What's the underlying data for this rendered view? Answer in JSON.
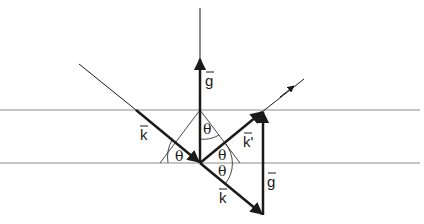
{
  "diagram": {
    "type": "bragg-reflection-vector-diagram",
    "labels": {
      "g_top": "g",
      "g_right": "g",
      "k_incident": "k",
      "k_prime": "k'",
      "k_lower": "k",
      "theta_left": "θ",
      "theta_top": "θ",
      "theta_right_upper": "θ",
      "theta_right_lower": "θ"
    },
    "colors": {
      "line": "#1a1a1a",
      "plane": "#8c8c8c",
      "background": "#ffffff"
    }
  }
}
